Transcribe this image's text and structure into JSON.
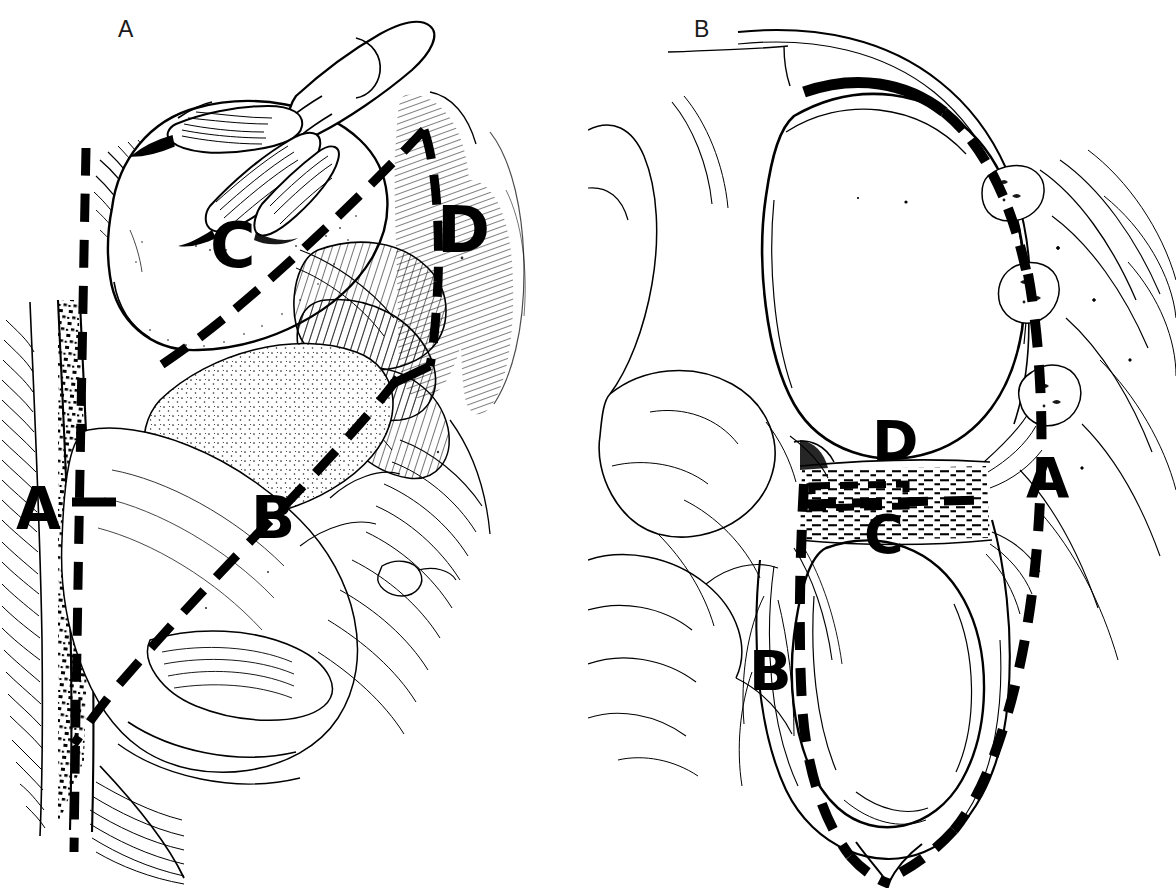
{
  "figure": {
    "background_color": "#ffffff",
    "ink_color": "#000000",
    "style": "pen-and-ink medical illustration, black line art on white",
    "width": 1176,
    "height": 888
  },
  "panels": [
    {
      "id": "panel-a",
      "letter": "A",
      "view": "operative exposure view with retracting fingers",
      "markers": [
        {
          "id": "mk-a-c",
          "label": "C",
          "x": 210,
          "y": 215
        },
        {
          "id": "mk-a-d",
          "label": "D",
          "x": 437,
          "y": 198
        },
        {
          "id": "mk-a-a",
          "label": "A",
          "x": 16,
          "y": 480
        },
        {
          "id": "mk-a-b",
          "label": "B",
          "x": 251,
          "y": 489
        }
      ]
    },
    {
      "id": "panel-b",
      "letter": "B",
      "view": "sagittal cross-section through chest wall and ribs",
      "markers": [
        {
          "id": "mk-b-d",
          "label": "D",
          "x": 872,
          "y": 413
        },
        {
          "id": "mk-b-a",
          "label": "A",
          "x": 1026,
          "y": 450
        },
        {
          "id": "mk-b-c",
          "label": "C",
          "x": 864,
          "y": 508
        },
        {
          "id": "mk-b-b",
          "label": "B",
          "x": 749,
          "y": 643
        }
      ]
    }
  ],
  "legend_keys": [
    "A",
    "B",
    "C",
    "D"
  ]
}
